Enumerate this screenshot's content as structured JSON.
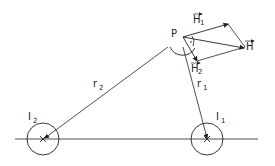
{
  "diagram": {
    "labels": {
      "point": "P",
      "h1": "H",
      "h1_sub": "1",
      "h2": "H",
      "h2_sub": "2",
      "h": "H",
      "r1": "r",
      "r1_sub": "1",
      "r2": "r",
      "r2_sub": "2",
      "i1": "I",
      "i1_sub": "1",
      "i2": "I",
      "i2_sub": "2"
    },
    "colors": {
      "stroke": "#222222",
      "background": "#ffffff"
    }
  }
}
